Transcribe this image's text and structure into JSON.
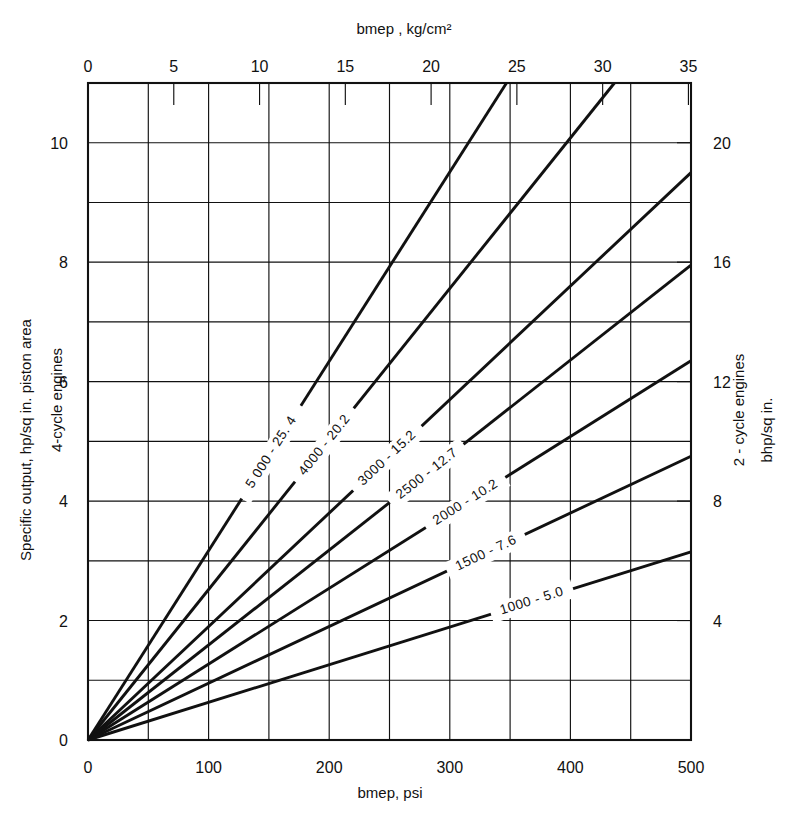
{
  "figure": {
    "background_color": "#ffffff",
    "ink_color": "#111111"
  },
  "axes": {
    "top": {
      "title": "bmep , kg/cm²",
      "tick_labels": [
        "0",
        "5",
        "10",
        "15",
        "20",
        "25",
        "30",
        "35"
      ],
      "tick_values": [
        0,
        5,
        10,
        15,
        20,
        25,
        30,
        35
      ],
      "range": [
        0,
        35.15
      ]
    },
    "bottom": {
      "title": "bmep, psi",
      "tick_labels": [
        "0",
        "100",
        "200",
        "300",
        "400",
        "500"
      ],
      "tick_values": [
        0,
        100,
        200,
        300,
        400,
        500
      ],
      "range": [
        0,
        500
      ]
    },
    "left": {
      "title_line1": "Specific output, hp/sq in. piston area",
      "title_line2": "4-cycle engines",
      "tick_labels": [
        "0",
        "2",
        "4",
        "6",
        "8",
        "10"
      ],
      "tick_values": [
        0,
        2,
        4,
        6,
        8,
        10
      ],
      "range": [
        0,
        11
      ]
    },
    "right": {
      "title_line1": "2 - cycle engines",
      "title_line2": "bhp/sq in.",
      "tick_labels": [
        "4",
        "8",
        "12",
        "16",
        "20"
      ],
      "tick_values": [
        4,
        8,
        12,
        16,
        20
      ],
      "range": [
        0,
        22
      ]
    }
  },
  "chart_data": {
    "type": "line",
    "title": "",
    "xlabel": "bmep, psi",
    "ylabel": "Specific output, hp/sq in. piston area (4-cycle engines)",
    "xlabel_secondary": "bmep , kg/cm²",
    "ylabel_secondary": "bhp/sq in. (2 - cycle engines)",
    "xlim": [
      0,
      500
    ],
    "ylim": [
      0,
      11
    ],
    "xlim_secondary": [
      0,
      35.15
    ],
    "ylim_secondary": [
      0,
      22
    ],
    "grid": true,
    "legend": "inline-curve-labels",
    "x_major_step": 100,
    "x_grid_step": 50,
    "y_major_step": 2,
    "y_grid_step": 1,
    "series": [
      {
        "name": "5000 - 25.4",
        "label": "5 000 - 25. 4",
        "rpm": 5000,
        "piston_speed_mps": 25.4,
        "slope_per_psi": 0.0317,
        "points_psi": [
          0,
          500
        ],
        "points_y": [
          0,
          15.85
        ],
        "exits": "top",
        "label_pos": {
          "x_psi": 152,
          "y": 4.82
        }
      },
      {
        "name": "4000 - 20.2",
        "label": "4000 - 20.2",
        "rpm": 4000,
        "piston_speed_mps": 20.2,
        "slope_per_psi": 0.0252,
        "points_psi": [
          0,
          500
        ],
        "points_y": [
          0,
          12.6
        ],
        "exits": "top",
        "label_pos": {
          "x_psi": 196,
          "y": 4.94
        }
      },
      {
        "name": "3000 - 15.2",
        "label": "3000 - 15.2",
        "rpm": 3000,
        "piston_speed_mps": 15.2,
        "slope_per_psi": 0.019,
        "points_psi": [
          0,
          500
        ],
        "points_y": [
          0,
          9.5
        ],
        "exits": "right",
        "label_pos": {
          "x_psi": 248,
          "y": 4.72
        }
      },
      {
        "name": "2500 - 12.7",
        "label": "2500 - 12.7",
        "rpm": 2500,
        "piston_speed_mps": 12.7,
        "slope_per_psi": 0.0159,
        "points_psi": [
          0,
          500
        ],
        "points_y": [
          0,
          7.95
        ],
        "exits": "right",
        "label_pos": {
          "x_psi": 281,
          "y": 4.46
        }
      },
      {
        "name": "2000 - 10.2",
        "label": "2000 - 10.2",
        "rpm": 2000,
        "piston_speed_mps": 10.2,
        "slope_per_psi": 0.0127,
        "points_psi": [
          0,
          500
        ],
        "points_y": [
          0,
          6.35
        ],
        "exits": "right",
        "label_pos": {
          "x_psi": 313,
          "y": 3.98
        }
      },
      {
        "name": "1500 - 7.6",
        "label": "1500 - 7.6",
        "rpm": 1500,
        "piston_speed_mps": 7.6,
        "slope_per_psi": 0.0095,
        "points_psi": [
          0,
          500
        ],
        "points_y": [
          0,
          4.75
        ],
        "exits": "right",
        "label_pos": {
          "x_psi": 330,
          "y": 3.13
        }
      },
      {
        "name": "1000 - 5.0",
        "label": "1000 - 5.0",
        "rpm": 1000,
        "piston_speed_mps": 5.0,
        "slope_per_psi": 0.0063,
        "points_psi": [
          0,
          500
        ],
        "points_y": [
          0,
          3.15
        ],
        "exits": "right",
        "label_pos": {
          "x_psi": 368,
          "y": 2.33
        }
      }
    ]
  }
}
